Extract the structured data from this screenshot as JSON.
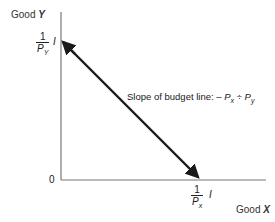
{
  "diagram": {
    "title": "Budget line",
    "y_axis": {
      "label_prefix": "Good",
      "label_var": "Y"
    },
    "x_axis": {
      "label_prefix": "Good",
      "label_var": "X"
    },
    "origin": "0",
    "y_intercept": {
      "numerator": "1",
      "denominator_base": "P",
      "denominator_sub": "Y",
      "multiplier": "I"
    },
    "x_intercept": {
      "numerator": "1",
      "denominator_base": "P",
      "denominator_sub": "x",
      "multiplier": "I"
    },
    "slope_label": {
      "prefix": "Slope of budget line:",
      "minus": "–",
      "p1_base": "P",
      "p1_sub": "x",
      "divide": "÷",
      "p2_base": "P",
      "p2_sub": "y"
    },
    "colors": {
      "axis": "#777777",
      "budget_line": "#1a1a1a",
      "text": "#333333"
    }
  }
}
